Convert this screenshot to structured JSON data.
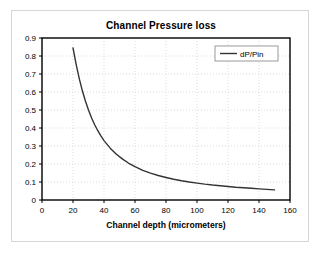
{
  "chart_data": {
    "type": "line",
    "title": "Channel Pressure loss",
    "xlabel": "Channel depth (micrometers)",
    "ylabel": "",
    "xlim": [
      0,
      160
    ],
    "ylim": [
      0,
      0.9
    ],
    "xticks": [
      0,
      20,
      40,
      60,
      80,
      100,
      120,
      140,
      160
    ],
    "xtick_labels": [
      "0",
      "20",
      "40",
      "60",
      "80",
      "100",
      "120",
      "140",
      "160"
    ],
    "yticks": [
      0,
      0.1,
      0.2,
      0.3,
      0.4,
      0.5,
      0.6,
      0.7,
      0.8,
      0.9
    ],
    "ytick_labels": [
      "0",
      "0.1",
      "0.2",
      "0.3",
      "0.4",
      "0.5",
      "0.6",
      "0.7",
      "0.8",
      "0.9"
    ],
    "grid": true,
    "legend_position": "top-right",
    "series": [
      {
        "name": "dP/Pin",
        "color": "#333333",
        "x": [
          20,
          22,
          24,
          26,
          28,
          30,
          32,
          34,
          36,
          38,
          40,
          44,
          48,
          52,
          56,
          60,
          65,
          70,
          75,
          80,
          85,
          90,
          95,
          100,
          105,
          110,
          115,
          120,
          125,
          130,
          135,
          140,
          145,
          150
        ],
        "values": [
          0.845,
          0.755,
          0.676,
          0.608,
          0.55,
          0.5,
          0.456,
          0.418,
          0.385,
          0.356,
          0.33,
          0.288,
          0.254,
          0.227,
          0.204,
          0.185,
          0.165,
          0.149,
          0.136,
          0.125,
          0.115,
          0.107,
          0.1,
          0.094,
          0.088,
          0.083,
          0.079,
          0.075,
          0.071,
          0.068,
          0.065,
          0.062,
          0.059,
          0.056
        ]
      }
    ]
  },
  "legend": {
    "entries": [
      {
        "label": "dP/Pin"
      }
    ]
  },
  "colors": {
    "series": "#333333",
    "axis": "#000000",
    "grid": "#cfcfcf",
    "frame": "#d7d7d7",
    "background": "#ffffff"
  }
}
